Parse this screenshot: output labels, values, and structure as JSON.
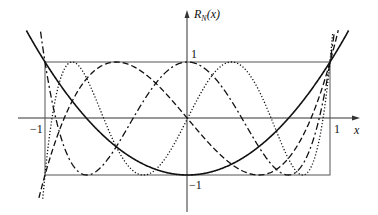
{
  "chart_data": {
    "type": "line",
    "title": "",
    "xlabel": "x",
    "ylabel": "R_N(x)",
    "ylabel_main": "R",
    "ylabel_sub": "N",
    "ylabel_arg": "(x)",
    "xlim": [
      -1.2,
      1.2
    ],
    "ylim": [
      -1.4,
      1.6
    ],
    "grid": false,
    "legend": "none",
    "x_ticks": [
      {
        "value": -1,
        "label": "−1"
      },
      {
        "value": 1,
        "label": "1"
      }
    ],
    "y_ticks": [
      {
        "value": 1,
        "label": "1"
      },
      {
        "value": -1,
        "label": "−1"
      }
    ],
    "bounding_box": {
      "x": [
        -1,
        1
      ],
      "y": [
        -1,
        1
      ]
    },
    "series": [
      {
        "name": "N=2",
        "formula": "2x^2-1",
        "style": "solid",
        "coeffs": [
          -1,
          0,
          2
        ]
      },
      {
        "name": "N=3",
        "formula": "4x^3-3x",
        "style": "dashed",
        "coeffs": [
          0,
          -3,
          0,
          4
        ]
      },
      {
        "name": "N=4",
        "formula": "8x^4-8x^2+1",
        "style": "dashdot",
        "coeffs": [
          1,
          0,
          -8,
          0,
          8
        ]
      },
      {
        "name": "N=5",
        "formula": "16x^5-20x^3+5x",
        "style": "dotted",
        "coeffs": [
          0,
          5,
          0,
          -20,
          0,
          16
        ]
      }
    ]
  },
  "labels": {
    "x_axis": "x",
    "x_neg_one": "−1",
    "x_one": "1",
    "y_one": "1",
    "y_neg_one": "−1"
  }
}
